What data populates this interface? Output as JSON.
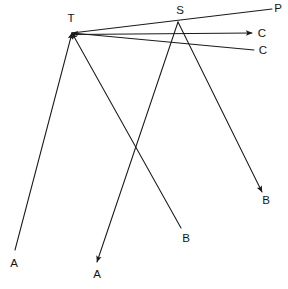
{
  "diagram": {
    "background_color": "#ffffff",
    "stroke_color": "#1a1a1a",
    "label_color": "#141414",
    "width": 288,
    "height": 289,
    "vertices": [
      {
        "id": "T",
        "label": "T",
        "x": 72,
        "y": 33,
        "label_x": 71,
        "label_y": 19
      },
      {
        "id": "S",
        "label": "S",
        "x": 178,
        "y": 22,
        "label_x": 180,
        "label_y": 11
      }
    ],
    "endpoints": [
      {
        "id": "A-left",
        "label": "A",
        "x": 15,
        "y": 250,
        "label_x": 14,
        "label_y": 264
      },
      {
        "id": "A-bottom",
        "label": "A",
        "x": 97,
        "y": 262,
        "label_x": 97,
        "label_y": 275
      },
      {
        "id": "B-lower",
        "label": "B",
        "x": 181,
        "y": 228,
        "label_x": 186,
        "label_y": 239
      },
      {
        "id": "B-right",
        "label": "B",
        "x": 262,
        "y": 192,
        "label_x": 266,
        "label_y": 201
      },
      {
        "id": "P-top",
        "label": "P",
        "x": 272,
        "y": 9,
        "label_x": 278,
        "label_y": 9
      },
      {
        "id": "C-upper",
        "label": "C",
        "x": 252,
        "y": 33,
        "label_x": 262,
        "label_y": 34
      },
      {
        "id": "C-lower",
        "label": "C",
        "x": 254,
        "y": 50,
        "label_x": 263,
        "label_y": 51
      }
    ],
    "rays": [
      {
        "id": "ray-A-left-to-T",
        "from": "A-left",
        "to": "T",
        "arrow_at": "to",
        "description": "incident ray from lower-left A up to T"
      },
      {
        "id": "ray-B-lower-to-T",
        "from": "B-lower",
        "to": "T",
        "arrow_at": "to",
        "description": "incident ray from B up-left to T"
      },
      {
        "id": "ray-C-lower-to-T",
        "from": "C-lower",
        "to": "T",
        "arrow_at": "to",
        "description": "long nearly horizontal ray from right C leftwards into T"
      },
      {
        "id": "ray-T-through-S-P",
        "from": "T",
        "to": "P-top",
        "arrow_at": "none",
        "description": "line from T through S continuing to P"
      },
      {
        "id": "ray-S-to-C-upper",
        "from": "S",
        "to": "C-upper",
        "arrow_at": "to",
        "description": "ray from S to upper C"
      },
      {
        "id": "ray-S-to-A-bottom",
        "from": "S",
        "to": "A-bottom",
        "arrow_at": "to",
        "description": "ray from S down-left to bottom A"
      },
      {
        "id": "ray-S-to-B-right",
        "from": "S",
        "to": "B-right",
        "arrow_at": "to",
        "description": "ray from S down-right to B"
      }
    ]
  }
}
